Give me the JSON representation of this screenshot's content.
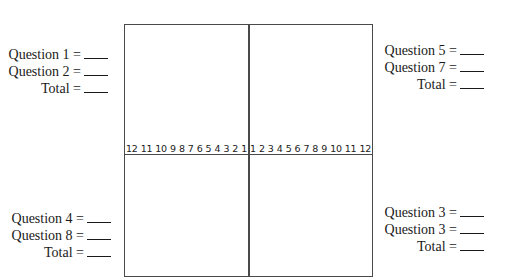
{
  "axis": {
    "left_ticks": [
      "12",
      "11",
      "10",
      "9",
      "8",
      "7",
      "6",
      "5",
      "4",
      "3",
      "2",
      "1"
    ],
    "right_ticks": [
      "1",
      "2",
      "3",
      "4",
      "5",
      "6",
      "7",
      "8",
      "9",
      "10",
      "11",
      "12"
    ]
  },
  "score_groups": {
    "top_left": {
      "rows": [
        {
          "label": "Question 1 =",
          "value": ""
        },
        {
          "label": "Question 2 =",
          "value": ""
        },
        {
          "label": "Total =",
          "value": ""
        }
      ]
    },
    "top_right": {
      "rows": [
        {
          "label": "Question 5 =",
          "value": ""
        },
        {
          "label": "Question 7 =",
          "value": ""
        },
        {
          "label": "Total =",
          "value": ""
        }
      ]
    },
    "bottom_left": {
      "rows": [
        {
          "label": "Question 4 =",
          "value": ""
        },
        {
          "label": "Question 8 =",
          "value": ""
        },
        {
          "label": "Total =",
          "value": ""
        }
      ]
    },
    "bottom_right": {
      "rows": [
        {
          "label": "Question 3 =",
          "value": ""
        },
        {
          "label": "Question 3 =",
          "value": ""
        },
        {
          "label": "Total =",
          "value": ""
        }
      ]
    }
  },
  "colors": {
    "line": "#4a4a4a",
    "text": "#1a1a1a",
    "background": "#ffffff"
  }
}
